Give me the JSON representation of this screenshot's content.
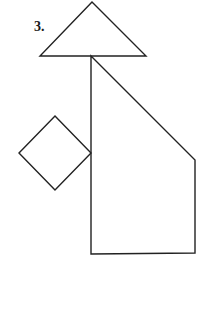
{
  "figure": {
    "label": "3.",
    "stroke_color": "#222222",
    "shapes": [
      {
        "name": "triangle",
        "points": "92,2 40,56 146,56"
      },
      {
        "name": "pentagon",
        "points": "91,56 195,160 195,253 91,254"
      },
      {
        "name": "diamond",
        "points": "55,116 91,153 55,190 19,153"
      }
    ]
  }
}
